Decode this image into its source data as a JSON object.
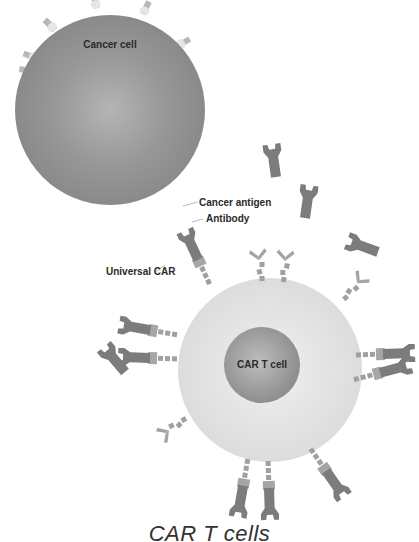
{
  "diagram": {
    "title": "CAR T cells",
    "nodes": {
      "cancer_cell": {
        "label": "Cancer cell",
        "color": "#8e8e8e"
      },
      "car_t_cell": {
        "label": "CAR T cell",
        "color": "#9a9a9a",
        "membrane_color": "#e2e2e2"
      }
    },
    "annotations": {
      "cancer_antigen": "Cancer antigen",
      "antibody": "Antibody",
      "universal_car": "Universal CAR"
    },
    "colors": {
      "antibody": "#7a7a7a",
      "receptor": "#9a9a9a",
      "antigen": "#d6d6d6"
    }
  }
}
